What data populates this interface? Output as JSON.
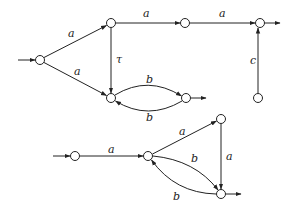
{
  "diagrams": [
    {
      "name": "automaton-1",
      "nodes": [
        {
          "id": "s0",
          "x": 40,
          "y": 60,
          "initial": true
        },
        {
          "id": "s1",
          "x": 111,
          "y": 23
        },
        {
          "id": "s2",
          "x": 185,
          "y": 23
        },
        {
          "id": "s3",
          "x": 260,
          "y": 23,
          "final": true
        },
        {
          "id": "s4",
          "x": 111,
          "y": 98
        },
        {
          "id": "s5",
          "x": 186,
          "y": 98,
          "final": true
        },
        {
          "id": "s6",
          "x": 258,
          "y": 98
        }
      ],
      "edges": [
        {
          "from": "s0",
          "to": "s1",
          "label": "a"
        },
        {
          "from": "s0",
          "to": "s4",
          "label": "a"
        },
        {
          "from": "s1",
          "to": "s2",
          "label": "a"
        },
        {
          "from": "s2",
          "to": "s3",
          "label": "a"
        },
        {
          "from": "s1",
          "to": "s4",
          "label": "τ"
        },
        {
          "from": "s4",
          "to": "s5",
          "label": "b"
        },
        {
          "from": "s5",
          "to": "s4",
          "label": "b"
        },
        {
          "from": "s6",
          "to": "s3",
          "label": "c"
        }
      ]
    },
    {
      "name": "automaton-2",
      "nodes": [
        {
          "id": "t0",
          "x": 75,
          "y": 156,
          "initial": true
        },
        {
          "id": "t1",
          "x": 148,
          "y": 156
        },
        {
          "id": "t2",
          "x": 221,
          "y": 119
        },
        {
          "id": "t3",
          "x": 221,
          "y": 194,
          "final": true
        }
      ],
      "edges": [
        {
          "from": "t0",
          "to": "t1",
          "label": "a"
        },
        {
          "from": "t1",
          "to": "t2",
          "label": "a"
        },
        {
          "from": "t2",
          "to": "t3",
          "label": "a"
        },
        {
          "from": "t1",
          "to": "t3",
          "label": "b"
        },
        {
          "from": "t3",
          "to": "t1",
          "label": "b"
        }
      ]
    }
  ],
  "labels": {
    "d1_s0_s1": "a",
    "d1_s0_s4": "a",
    "d1_s1_s2": "a",
    "d1_s2_s3": "a",
    "d1_s1_s4": "τ",
    "d1_s4_s5": "b",
    "d1_s5_s4": "b",
    "d1_s6_s3": "c",
    "d2_t0_t1": "a",
    "d2_t1_t2": "a",
    "d2_t2_t3": "a",
    "d2_t1_t3": "b",
    "d2_t3_t1": "b"
  }
}
